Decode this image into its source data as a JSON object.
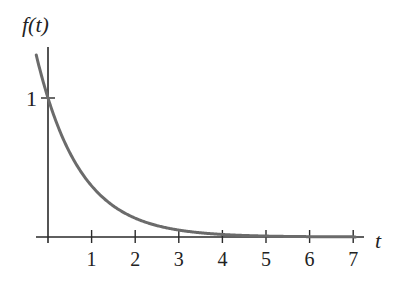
{
  "chart_data": {
    "type": "line",
    "title": "",
    "xlabel": "t",
    "ylabel": "f(t)",
    "xlim": [
      -0.27,
      7.3
    ],
    "ylim": [
      0,
      1.4
    ],
    "x_ticks": [
      1,
      2,
      3,
      4,
      5,
      6,
      7
    ],
    "x_tick_labels": [
      "1",
      "2",
      "3",
      "4",
      "5",
      "6",
      "7"
    ],
    "y_ticks": [
      1
    ],
    "y_tick_labels": [
      "1"
    ],
    "grid": false,
    "legend": null,
    "series": [
      {
        "name": "f(t) = e^(-t)",
        "x": [
          -0.27,
          0,
          0.5,
          1,
          1.5,
          2,
          2.5,
          3,
          3.5,
          4,
          4.5,
          5,
          5.5,
          6,
          6.5,
          7
        ],
        "values": [
          1.31,
          1.0,
          0.61,
          0.37,
          0.22,
          0.14,
          0.08,
          0.05,
          0.03,
          0.02,
          0.01,
          0.007,
          0.004,
          0.002,
          0.0015,
          0.001
        ],
        "color": "#6b6b6b"
      }
    ]
  },
  "labels": {
    "y_axis": "f(t)",
    "x_axis": "t",
    "y_one": "1"
  },
  "colors": {
    "axis": "#2a2a2a",
    "curve": "#6b6b6b"
  }
}
